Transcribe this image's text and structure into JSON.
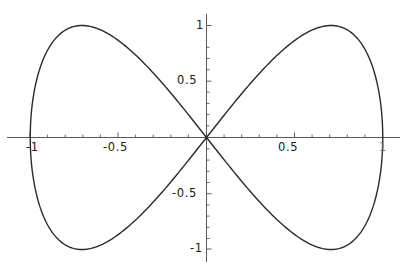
{
  "chart_data": {
    "type": "line",
    "title": "",
    "subtitle": "",
    "xlabel": "",
    "ylabel": "",
    "xlim": [
      -1.1,
      1.1
    ],
    "ylim": [
      -1.15,
      1.15
    ],
    "grid": false,
    "legend": null,
    "axes_style": "crossed-at-origin",
    "x_ticks": {
      "major_values": [
        -1,
        -0.5,
        0.5,
        1
      ],
      "major_labels": [
        "-1",
        "-0.5",
        "0.5",
        "1"
      ],
      "minor_step": 0.1
    },
    "y_ticks": {
      "major_values": [
        -1,
        -0.5,
        0.5,
        1
      ],
      "major_labels": [
        "-1",
        "-0.5",
        "0.5",
        "1"
      ],
      "minor_step": 0.1
    },
    "series": [
      {
        "name": "figure-eight",
        "closed": true,
        "color": "#2b2b2b",
        "line_width": 1.4,
        "parametric": "x = sin(t), y = sin(2t)",
        "x": [
          0.0,
          0.309,
          0.588,
          0.809,
          0.951,
          1.0,
          0.951,
          0.809,
          0.588,
          0.309,
          0.0,
          -0.309,
          -0.588,
          -0.809,
          -0.951,
          -1.0,
          -0.951,
          -0.809,
          -0.588,
          -0.309,
          0.0
        ],
        "y": [
          0.0,
          0.588,
          0.951,
          0.951,
          0.588,
          0.0,
          -0.588,
          -0.951,
          -0.951,
          -0.588,
          0.0,
          0.588,
          0.951,
          0.951,
          0.588,
          0.0,
          -0.588,
          -0.951,
          -0.951,
          -0.588,
          0.0
        ],
        "key_points": {
          "origin_crossing": [
            0,
            0
          ],
          "right_extreme": [
            1,
            0
          ],
          "left_extreme": [
            -1,
            0
          ],
          "upper_right_peak": [
            0.707,
            1
          ],
          "upper_left_peak": [
            -0.707,
            1
          ],
          "lower_right_trough": [
            0.707,
            -1
          ],
          "lower_left_trough": [
            -0.707,
            -1
          ]
        }
      }
    ]
  },
  "axis_labels": {
    "x_neg_one": "-1",
    "x_neg_half": "-0.5",
    "x_pos_half": "0.5",
    "x_pos_one": "1",
    "y_pos_one": "1",
    "y_pos_half": "0.5",
    "y_neg_half": "-0.5",
    "y_neg_one": "-1"
  },
  "colors": {
    "curve": "#2b2b2b",
    "axis": "#5a5a5a",
    "tick": "#5a5a5a",
    "label": "#1a1a1a",
    "background": "#ffffff"
  }
}
